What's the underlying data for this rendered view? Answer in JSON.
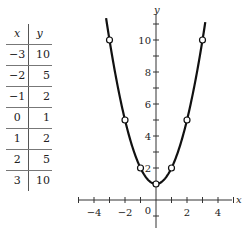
{
  "table": {
    "headers": [
      "x",
      "y"
    ],
    "rows": [
      {
        "x": "−3",
        "y": "10"
      },
      {
        "x": "−2",
        "y": "5"
      },
      {
        "x": "−1",
        "y": "2"
      },
      {
        "x": "0",
        "y": "1"
      },
      {
        "x": "1",
        "y": "2"
      },
      {
        "x": "2",
        "y": "5"
      },
      {
        "x": "3",
        "y": "10"
      }
    ]
  },
  "chart_data": {
    "type": "line",
    "title": "",
    "function": "y = x^2 + 1",
    "xlabel": "x",
    "ylabel": "y",
    "x": [
      -3,
      -2,
      -1,
      0,
      1,
      2,
      3
    ],
    "values": [
      10,
      5,
      2,
      1,
      2,
      5,
      10
    ],
    "x_tick_labels": [
      "−4",
      "−2",
      "0",
      "2",
      "4"
    ],
    "y_tick_labels": [
      "2",
      "4",
      "6",
      "8",
      "10"
    ],
    "xlim": [
      -5,
      5
    ],
    "ylim": [
      -1,
      11
    ],
    "grid": false,
    "markers": "open circles"
  },
  "axes": {
    "x_label": "x",
    "y_label": "y",
    "x_ticks": [
      {
        "v": -4,
        "label": "−4"
      },
      {
        "v": -2,
        "label": "−2"
      },
      {
        "v": 2,
        "label": "2"
      },
      {
        "v": 4,
        "label": "4"
      }
    ],
    "origin_label": "0",
    "y_ticks": [
      {
        "v": 2,
        "label": "2"
      },
      {
        "v": 4,
        "label": "4"
      },
      {
        "v": 6,
        "label": "6"
      },
      {
        "v": 8,
        "label": "8"
      },
      {
        "v": 10,
        "label": "10"
      }
    ]
  }
}
